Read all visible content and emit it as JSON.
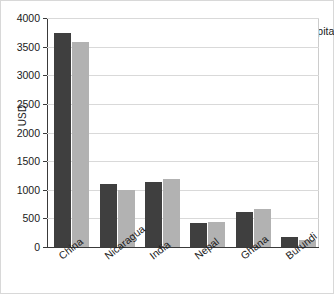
{
  "chart_data": {
    "type": "bar",
    "title": "",
    "xlabel": "",
    "ylabel": "USD",
    "ylim": [
      0,
      4000
    ],
    "grid": true,
    "legend_position": "top-right",
    "categories": [
      "China",
      "Nicaragua",
      "India",
      "Nepal",
      "Ghana",
      "Burundi"
    ],
    "yticks": [
      0,
      500,
      1000,
      1500,
      2000,
      2500,
      3000,
      3500,
      4000
    ],
    "ytick_labels": [
      "0",
      "500",
      "1000",
      "1500",
      "2000",
      "2500",
      "3000",
      "3500",
      "4000"
    ],
    "series": [
      {
        "name": "GDP per capita",
        "color": "#3f3f3f",
        "values": [
          3730,
          1100,
          1130,
          420,
          620,
          170
        ]
      },
      {
        "name": "GNI per capita",
        "color": "#b2b2b2",
        "values": [
          3580,
          1000,
          1190,
          440,
          670,
          120
        ]
      }
    ]
  }
}
